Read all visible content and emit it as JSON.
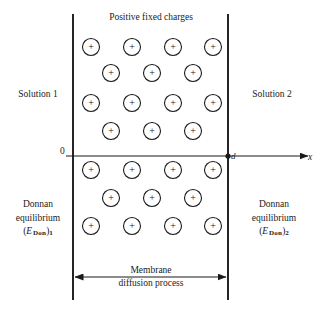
{
  "figure": {
    "title": "Positive fixed charges",
    "left_region_label": "Solution 1",
    "right_region_label": "Solution 2",
    "membrane_caption_line1": "Membrane",
    "membrane_caption_line2": "diffusion process",
    "donnan_left": {
      "line1": "Donnan",
      "line2": "equilibrium",
      "symbol_open": "(",
      "symbol_var": "E",
      "symbol_sub": "Don",
      "symbol_close": ")",
      "symbol_index": "1"
    },
    "donnan_right": {
      "line1": "Donnan",
      "line2": "equilibrium",
      "symbol_open": "(",
      "symbol_var": "E",
      "symbol_sub": "Don",
      "symbol_close": ")",
      "symbol_index": "2"
    },
    "axis": {
      "origin_label": "0",
      "thickness_label": "d",
      "x_axis_label": "x"
    },
    "charge_symbol": "+",
    "colors": {
      "stroke": "#1a1a1a",
      "background": "#ffffff",
      "text": "#1a1a1a"
    },
    "geometry": {
      "membrane_left_x": 73,
      "membrane_right_x": 228,
      "membrane_top_y": 14,
      "membrane_bottom_y": 300,
      "axis_y": 156,
      "axis_end_x": 310,
      "charge_radius": 8.5,
      "dimension_arrow_y": 277
    },
    "charges": [
      {
        "row": 1,
        "cx": 91,
        "cy": 47
      },
      {
        "row": 1,
        "cx": 132,
        "cy": 47
      },
      {
        "row": 1,
        "cx": 173,
        "cy": 47
      },
      {
        "row": 1,
        "cx": 213,
        "cy": 47
      },
      {
        "row": 2,
        "cx": 111,
        "cy": 73
      },
      {
        "row": 2,
        "cx": 152,
        "cy": 73
      },
      {
        "row": 2,
        "cx": 193,
        "cy": 73
      },
      {
        "row": 3,
        "cx": 91,
        "cy": 103
      },
      {
        "row": 3,
        "cx": 132,
        "cy": 103
      },
      {
        "row": 3,
        "cx": 173,
        "cy": 103
      },
      {
        "row": 3,
        "cx": 213,
        "cy": 103
      },
      {
        "row": 4,
        "cx": 111,
        "cy": 131
      },
      {
        "row": 4,
        "cx": 152,
        "cy": 131
      },
      {
        "row": 4,
        "cx": 193,
        "cy": 131
      },
      {
        "row": 5,
        "cx": 91,
        "cy": 170
      },
      {
        "row": 5,
        "cx": 132,
        "cy": 170
      },
      {
        "row": 5,
        "cx": 173,
        "cy": 170
      },
      {
        "row": 5,
        "cx": 213,
        "cy": 170
      },
      {
        "row": 6,
        "cx": 111,
        "cy": 198
      },
      {
        "row": 6,
        "cx": 152,
        "cy": 198
      },
      {
        "row": 6,
        "cx": 193,
        "cy": 198
      },
      {
        "row": 7,
        "cx": 91,
        "cy": 226
      },
      {
        "row": 7,
        "cx": 132,
        "cy": 226
      },
      {
        "row": 7,
        "cx": 173,
        "cy": 226
      },
      {
        "row": 7,
        "cx": 213,
        "cy": 226
      }
    ]
  }
}
